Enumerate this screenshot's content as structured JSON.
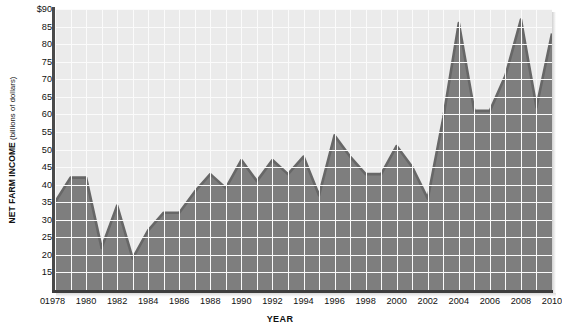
{
  "chart_data": {
    "type": "area",
    "title": "",
    "xlabel": "YEAR",
    "ylabel": "NET FARM INCOME (billions of dollars)",
    "ylabel_main": "NET FARM INCOME",
    "ylabel_sub": " (billions of dollars)",
    "ylim": [
      10,
      90
    ],
    "xlim": [
      1978,
      2010
    ],
    "grid": true,
    "legend": false,
    "y_tick_labels": [
      "$90",
      "85",
      "80",
      "75",
      "70",
      "65",
      "60",
      "55",
      "50",
      "45",
      "40",
      "35",
      "30",
      "25",
      "20",
      "15"
    ],
    "y_ticks": [
      90,
      85,
      80,
      75,
      70,
      65,
      60,
      55,
      50,
      45,
      40,
      35,
      30,
      25,
      20,
      15
    ],
    "y_zero_label": "0",
    "x_tick_labels": [
      "1978",
      "1980",
      "1982",
      "1984",
      "1986",
      "1988",
      "1990",
      "1992",
      "1994",
      "1996",
      "1998",
      "2000",
      "2002",
      "2004",
      "2006",
      "2008",
      "2010"
    ],
    "x_ticks": [
      1978,
      1980,
      1982,
      1984,
      1986,
      1988,
      1990,
      1992,
      1994,
      1996,
      1998,
      2000,
      2002,
      2004,
      2006,
      2008,
      2010
    ],
    "x": [
      1978,
      1979,
      1980,
      1981,
      1982,
      1983,
      1984,
      1985,
      1986,
      1987,
      1988,
      1989,
      1990,
      1991,
      1992,
      1993,
      1994,
      1995,
      1996,
      1997,
      1998,
      1999,
      2000,
      2001,
      2002,
      2003,
      2004,
      2005,
      2006,
      2007,
      2008,
      2009,
      2010
    ],
    "values": [
      35,
      42,
      42,
      22,
      34,
      19,
      27,
      32,
      32,
      38,
      43,
      39,
      47,
      41,
      47,
      43,
      48,
      37,
      54,
      48,
      43,
      43,
      51,
      45,
      36,
      59,
      86,
      61,
      61,
      71,
      87,
      62,
      83
    ],
    "series": [
      {
        "name": "Net farm income",
        "fill_color": "#7e7e7e",
        "line_color": "#666666",
        "values": [
          35,
          42,
          42,
          22,
          34,
          19,
          27,
          32,
          32,
          38,
          43,
          39,
          47,
          41,
          47,
          43,
          48,
          37,
          54,
          48,
          43,
          43,
          51,
          45,
          36,
          59,
          86,
          61,
          61,
          71,
          87,
          62,
          83
        ]
      }
    ],
    "colors": {
      "plot_background": "#ebebeb",
      "grid": "#fbfbfb",
      "area_fill": "#7e7e7e",
      "area_stroke": "#676767",
      "axis": "#3d3d3d",
      "text": "#111111"
    }
  }
}
